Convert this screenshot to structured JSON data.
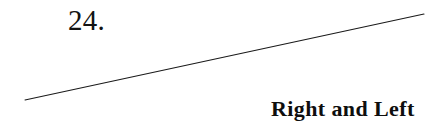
{
  "page": {
    "background_color": "#ffffff",
    "width": 446,
    "height": 131
  },
  "heading": {
    "section_number": "24.",
    "section_title": "Right and Left"
  },
  "rule": {
    "icon_name": "diagonal-rule-line",
    "color": "#1a1a1a",
    "stroke_width": 1.1,
    "x1": 25,
    "y1": 100,
    "x2": 424,
    "y2": 14
  }
}
